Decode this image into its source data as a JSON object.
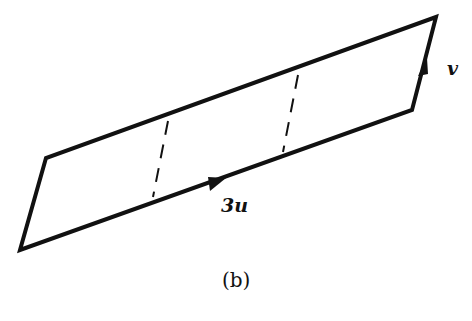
{
  "figure": {
    "caption": "(b)",
    "shape": "parallelogram",
    "vertices": [
      [
        20,
        250
      ],
      [
        46,
        158
      ],
      [
        436,
        17
      ],
      [
        412,
        110
      ]
    ],
    "dashed_dividers": [
      {
        "from": [
          168,
          121
        ],
        "to": [
          153,
          197
        ]
      },
      {
        "from": [
          298,
          75
        ],
        "to": [
          283,
          152
        ]
      }
    ],
    "edge_labels": {
      "bottom": "3u",
      "right": "v"
    },
    "stroke_color": "#111111",
    "background": "#ffffff"
  }
}
